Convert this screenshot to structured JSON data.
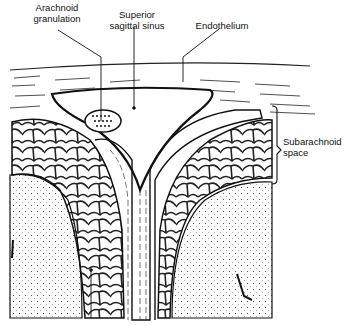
{
  "diagram": {
    "labels": {
      "arachnoid_granulation": "Arachnoid\ngranulation",
      "superior_sagittal_sinus": "Superior\nsagittal sinus",
      "endothelium": "Endothelium",
      "subarachnoid_space": "Subarachnoid\nspace"
    },
    "colors": {
      "ink": "#111111",
      "background": "#ffffff"
    }
  }
}
